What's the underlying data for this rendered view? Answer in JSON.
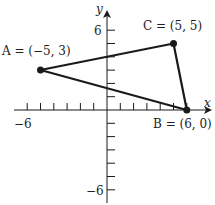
{
  "diagram": {
    "type": "coordinate-plane-triangle",
    "axes": {
      "x_label": "x",
      "y_label": "y",
      "x_min_label": "−6",
      "y_max_label": "6",
      "y_min_label": "−6",
      "x_range": [
        -6,
        6
      ],
      "y_range": [
        -6,
        6
      ],
      "tick_spacing": 1
    },
    "points": [
      {
        "name": "A",
        "label": "A = (−5, 3)",
        "x": -5,
        "y": 3
      },
      {
        "name": "B",
        "label": "B = (6, 0)",
        "x": 6,
        "y": 0
      },
      {
        "name": "C",
        "label": "C = (5, 5)",
        "x": 5,
        "y": 5
      }
    ],
    "segments": [
      [
        "A",
        "C"
      ],
      [
        "C",
        "B"
      ],
      [
        "B",
        "A"
      ]
    ],
    "colors": {
      "line": "#1a1a1a",
      "background": "#ffffff"
    }
  }
}
